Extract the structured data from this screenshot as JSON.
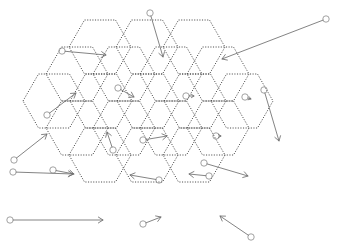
{
  "figure": {
    "background_color": "#ffffff",
    "width": 337,
    "height": 250
  },
  "grid": {
    "name": "hexagonal-honeycomb",
    "orientation": "flat-top",
    "rows": 5,
    "cells_per_row": [
      3,
      4,
      5,
      4,
      3
    ],
    "total_cells": 19,
    "cell_width": 62,
    "cell_height": 54,
    "border_style": "dotted",
    "border_color": "#3a3a3a",
    "fill_color": "none",
    "centers": [
      {
        "id": "c1",
        "x": 100,
        "y": 47
      },
      {
        "id": "c2",
        "x": 147,
        "y": 47
      },
      {
        "id": "c3",
        "x": 194,
        "y": 47
      },
      {
        "id": "c4",
        "x": 77,
        "y": 74
      },
      {
        "id": "c5",
        "x": 124,
        "y": 74
      },
      {
        "id": "c6",
        "x": 171,
        "y": 74
      },
      {
        "id": "c7",
        "x": 218,
        "y": 74
      },
      {
        "id": "c8",
        "x": 54,
        "y": 101
      },
      {
        "id": "c9",
        "x": 101,
        "y": 101
      },
      {
        "id": "c10",
        "x": 148,
        "y": 101
      },
      {
        "id": "c11",
        "x": 195,
        "y": 101
      },
      {
        "id": "c12",
        "x": 242,
        "y": 101
      },
      {
        "id": "c13",
        "x": 77,
        "y": 128
      },
      {
        "id": "c14",
        "x": 124,
        "y": 128
      },
      {
        "id": "c15",
        "x": 171,
        "y": 128
      },
      {
        "id": "c16",
        "x": 218,
        "y": 128
      },
      {
        "id": "c17",
        "x": 100,
        "y": 155
      },
      {
        "id": "c18",
        "x": 147,
        "y": 155
      },
      {
        "id": "c19",
        "x": 194,
        "y": 155
      }
    ]
  },
  "vectors": {
    "name": "vector-field-arrows",
    "count": 19,
    "shaft_color": "#6e6e6e",
    "tail_marker": "circle",
    "tail_radius": 3.2,
    "head_style": "open-arrow",
    "items": [
      {
        "id": "v1",
        "label": "arrow-top-long-down",
        "x1": 150,
        "y1": 13,
        "x2": 163,
        "y2": 57
      },
      {
        "id": "v2",
        "label": "arrow-top-right-long-left",
        "x1": 326,
        "y1": 19,
        "x2": 222,
        "y2": 59
      },
      {
        "id": "v3",
        "label": "arrow-upper-left-right",
        "x1": 62,
        "y1": 51,
        "x2": 106,
        "y2": 55
      },
      {
        "id": "v4",
        "label": "arrow-row2-left-upright",
        "x1": 47,
        "y1": 115,
        "x2": 76,
        "y2": 93
      },
      {
        "id": "v5",
        "label": "arrow-row2-mid-downright",
        "x1": 118,
        "y1": 88,
        "x2": 134,
        "y2": 97
      },
      {
        "id": "v6",
        "label": "arrow-row2-c6-tiny",
        "x1": 186,
        "y1": 96,
        "x2": 194,
        "y2": 96
      },
      {
        "id": "v7",
        "label": "arrow-row2-c7-tiny",
        "x1": 245,
        "y1": 97,
        "x2": 251,
        "y2": 99
      },
      {
        "id": "v8",
        "label": "arrow-right-long-down",
        "x1": 264,
        "y1": 90,
        "x2": 279,
        "y2": 141
      },
      {
        "id": "v9",
        "label": "arrow-row3-upleft-diag",
        "x1": 113,
        "y1": 150,
        "x2": 107,
        "y2": 132
      },
      {
        "id": "v10",
        "label": "arrow-row3-mid-right",
        "x1": 143,
        "y1": 140,
        "x2": 167,
        "y2": 136
      },
      {
        "id": "v11",
        "label": "arrow-row3-c11-tiny",
        "x1": 216,
        "y1": 136,
        "x2": 221,
        "y2": 136
      },
      {
        "id": "v12",
        "label": "arrow-left-diag-upright",
        "x1": 14,
        "y1": 160,
        "x2": 47,
        "y2": 134
      },
      {
        "id": "v13",
        "label": "arrow-left-long-right",
        "x1": 13,
        "y1": 172,
        "x2": 73,
        "y2": 174
      },
      {
        "id": "v14",
        "label": "arrow-row4-left-right",
        "x1": 53,
        "y1": 170,
        "x2": 74,
        "y2": 174
      },
      {
        "id": "v15",
        "label": "arrow-row4-mid-leftdown",
        "x1": 159,
        "y1": 180,
        "x2": 130,
        "y2": 175
      },
      {
        "id": "v16",
        "label": "arrow-row4-c16-left",
        "x1": 209,
        "y1": 176,
        "x2": 189,
        "y2": 174
      },
      {
        "id": "v17",
        "label": "arrow-row4-diag-downright",
        "x1": 204,
        "y1": 163,
        "x2": 248,
        "y2": 176
      },
      {
        "id": "v18",
        "label": "arrow-bottom-left-long",
        "x1": 10,
        "y1": 220,
        "x2": 103,
        "y2": 220
      },
      {
        "id": "v19",
        "label": "arrow-bottom-mid-upright",
        "x1": 143,
        "y1": 224,
        "x2": 161,
        "y2": 217
      },
      {
        "id": "v20",
        "label": "arrow-bottom-right-upleft",
        "x1": 251,
        "y1": 237,
        "x2": 220,
        "y2": 216
      }
    ]
  },
  "legend": {
    "visible": false,
    "entries": []
  },
  "chart_data": {
    "type": "scatter",
    "xlabel": "",
    "ylabel": "",
    "grid": false
  }
}
